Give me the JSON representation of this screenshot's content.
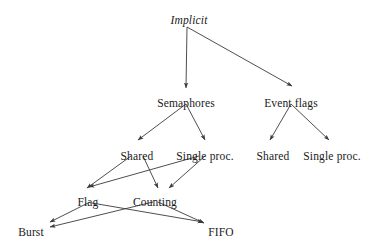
{
  "diagram": {
    "type": "tree",
    "title": "",
    "style": {
      "background": "#ffffff",
      "edge_color": "#3a3a3a",
      "text_color": "#1a1a1a"
    },
    "nodes": [
      {
        "id": "implicit",
        "label": "Implicit",
        "x": 189,
        "y": 14,
        "italic": true,
        "level": 0
      },
      {
        "id": "semaphores",
        "label": "Semaphores",
        "x": 186,
        "y": 97,
        "italic": false,
        "level": 1
      },
      {
        "id": "event-flags",
        "label": "Event flags",
        "x": 291,
        "y": 97,
        "italic": false,
        "level": 1
      },
      {
        "id": "sem-shared",
        "label": "Shared",
        "x": 137,
        "y": 150,
        "italic": false,
        "level": 2
      },
      {
        "id": "sem-single-proc",
        "label": "Single proc.",
        "x": 205,
        "y": 150,
        "italic": false,
        "level": 2
      },
      {
        "id": "flags-shared",
        "label": "Shared",
        "x": 273,
        "y": 150,
        "italic": false,
        "level": 2
      },
      {
        "id": "flags-single-proc",
        "label": "Single proc.",
        "x": 332,
        "y": 150,
        "italic": false,
        "level": 2
      },
      {
        "id": "flag",
        "label": "Flag",
        "x": 88,
        "y": 196,
        "italic": false,
        "level": 3
      },
      {
        "id": "counting",
        "label": "Counting",
        "x": 155,
        "y": 196,
        "italic": false,
        "level": 3
      },
      {
        "id": "burst",
        "label": "Burst",
        "x": 31,
        "y": 226,
        "italic": false,
        "level": 4
      },
      {
        "id": "fifo",
        "label": "FIFO",
        "x": 221,
        "y": 226,
        "italic": false,
        "level": 4
      }
    ],
    "edges": [
      {
        "id": "implicit-semaphores",
        "from": "implicit",
        "to": "semaphores",
        "x1": 187,
        "y1": 27,
        "x2": 186,
        "y2": 88
      },
      {
        "id": "implicit-event-flags",
        "from": "implicit",
        "to": "event-flags",
        "x1": 187,
        "y1": 27,
        "x2": 292,
        "y2": 86
      },
      {
        "id": "semaphores-shared",
        "from": "semaphores",
        "to": "sem-shared",
        "x1": 186,
        "y1": 104,
        "x2": 138,
        "y2": 140
      },
      {
        "id": "semaphores-single",
        "from": "semaphores",
        "to": "sem-single",
        "x1": 186,
        "y1": 104,
        "x2": 205,
        "y2": 140
      },
      {
        "id": "eventflags-shared",
        "from": "event-flags",
        "to": "flags-shared",
        "x1": 291,
        "y1": 104,
        "x2": 270,
        "y2": 140
      },
      {
        "id": "eventflags-single",
        "from": "event-flags",
        "to": "flags-single",
        "x1": 291,
        "y1": 104,
        "x2": 329,
        "y2": 140
      },
      {
        "id": "shared-flag",
        "from": "sem-shared",
        "to": "flag",
        "x1": 131,
        "y1": 156,
        "x2": 87,
        "y2": 188
      },
      {
        "id": "shared-counting",
        "from": "sem-shared",
        "to": "counting",
        "x1": 143,
        "y1": 156,
        "x2": 158,
        "y2": 188
      },
      {
        "id": "single-flag",
        "from": "sem-single",
        "to": "flag",
        "x1": 199,
        "y1": 156,
        "x2": 89,
        "y2": 187
      },
      {
        "id": "single-counting",
        "from": "sem-single",
        "to": "counting",
        "x1": 205,
        "y1": 156,
        "x2": 169,
        "y2": 188
      },
      {
        "id": "flag-burst",
        "from": "flag",
        "to": "burst",
        "x1": 90,
        "y1": 202,
        "x2": 50,
        "y2": 222
      },
      {
        "id": "flag-fifo",
        "from": "flag",
        "to": "fifo",
        "x1": 92,
        "y1": 203,
        "x2": 203,
        "y2": 222
      },
      {
        "id": "counting-burst",
        "from": "counting",
        "to": "burst",
        "x1": 153,
        "y1": 202,
        "x2": 50,
        "y2": 227
      },
      {
        "id": "counting-fifo",
        "from": "counting",
        "to": "fifo",
        "x1": 158,
        "y1": 202,
        "x2": 204,
        "y2": 223
      }
    ]
  }
}
